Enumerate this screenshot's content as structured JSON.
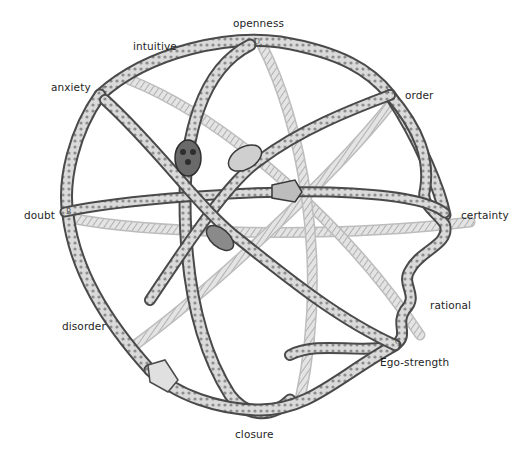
{
  "figure": {
    "colors": {
      "background": "#ffffff",
      "ring_outline": "#3a3a3a",
      "ring_fill": "#d9d9d9",
      "ring_texture": "#8a8a8a",
      "label_text": "#1e1e1e"
    },
    "labels": [
      {
        "id": "openness",
        "text": "openness",
        "x": 233,
        "y": 17
      },
      {
        "id": "intuitive",
        "text": "intuitive",
        "x": 133,
        "y": 40
      },
      {
        "id": "anxiety",
        "text": "anxiety",
        "x": 51,
        "y": 81
      },
      {
        "id": "order",
        "text": "order",
        "x": 405,
        "y": 89
      },
      {
        "id": "doubt",
        "text": "doubt",
        "x": 24,
        "y": 209
      },
      {
        "id": "certainty",
        "text": "certainty",
        "x": 461,
        "y": 209
      },
      {
        "id": "rational",
        "text": "rational",
        "x": 430,
        "y": 299
      },
      {
        "id": "disorder",
        "text": "disorder",
        "x": 62,
        "y": 320
      },
      {
        "id": "ego-strength",
        "text": "Ego-strength",
        "x": 380,
        "y": 356
      },
      {
        "id": "closure",
        "text": "closure",
        "x": 235,
        "y": 428
      }
    ],
    "ring_markers": [
      {
        "id": "marker-d-top",
        "text": "D",
        "x": 254,
        "y": 41
      },
      {
        "id": "marker-c-left",
        "text": "C",
        "x": 102,
        "y": 89
      },
      {
        "id": "marker-a-right",
        "text": "A",
        "x": 384,
        "y": 90
      },
      {
        "id": "marker-b-left",
        "text": "B",
        "x": 66,
        "y": 211
      },
      {
        "id": "marker-c-lower",
        "text": "C",
        "x": 395,
        "y": 341
      }
    ]
  }
}
